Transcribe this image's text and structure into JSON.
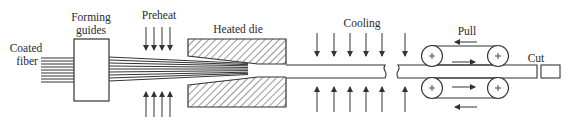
{
  "diagram": {
    "type": "process-flow",
    "labels": {
      "coated_fiber_line1": "Coated",
      "coated_fiber_line2": "fiber",
      "forming_guides_line1": "Forming",
      "forming_guides_line2": "guides",
      "preheat": "Preheat",
      "heated_die": "Heated die",
      "cooling": "Cooling",
      "pull": "Pull",
      "cut": "Cut"
    },
    "stages": [
      "Coated fiber",
      "Forming guides",
      "Preheat",
      "Heated die",
      "Cooling",
      "Pull",
      "Cut"
    ],
    "colors": {
      "stroke": "#333333",
      "background": "#ffffff",
      "text": "#2a2a2a"
    }
  }
}
